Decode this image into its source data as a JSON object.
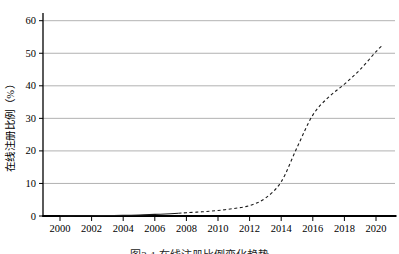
{
  "figure": {
    "background": "#ffffff",
    "caption": "图3-1 在线注册比例变化趋势"
  },
  "chart_data": {
    "type": "line",
    "title": "",
    "xlabel": "",
    "ylabel": "在线注册比例（%）",
    "x_ticks": [
      2000,
      2002,
      2004,
      2006,
      2008,
      2010,
      2012,
      2014,
      2016,
      2018,
      2020
    ],
    "y_ticks": [
      0,
      10,
      20,
      30,
      40,
      50,
      60
    ],
    "xlim": [
      1998.9,
      2021.2
    ],
    "ylim": [
      0,
      62
    ],
    "grid": "horizontal",
    "legend": "none",
    "colors": {
      "axis": "#000000",
      "gridline": "#9e9e9e",
      "line": "#1a1a1a",
      "text": "#000000"
    },
    "series": [
      {
        "name": "在线注册比例",
        "style": "dashed",
        "solid_until_year": 2007.5,
        "points": [
          [
            2000,
            0.05
          ],
          [
            2001,
            0.05
          ],
          [
            2002,
            0.1
          ],
          [
            2003,
            0.15
          ],
          [
            2004,
            0.2
          ],
          [
            2005,
            0.3
          ],
          [
            2006,
            0.5
          ],
          [
            2007,
            0.7
          ],
          [
            2007.5,
            0.85
          ],
          [
            2008,
            1.0
          ],
          [
            2009,
            1.3
          ],
          [
            2010,
            1.7
          ],
          [
            2011,
            2.3
          ],
          [
            2012,
            3.2
          ],
          [
            2013,
            5.5
          ],
          [
            2014,
            10.5
          ],
          [
            2015,
            21
          ],
          [
            2016,
            31
          ],
          [
            2017,
            36.5
          ],
          [
            2018,
            40.5
          ],
          [
            2019,
            45
          ],
          [
            2020,
            50.5
          ],
          [
            2020.4,
            52.4
          ]
        ]
      }
    ]
  }
}
